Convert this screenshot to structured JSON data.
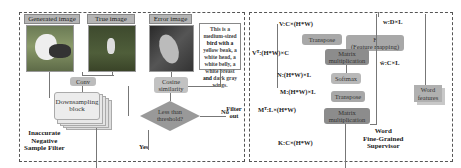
{
  "left_panel": {
    "title": "Inaccurate\nNegative\nSample Filter",
    "title_lines": [
      "Inaccurate",
      "Negative",
      "Sample Filter"
    ],
    "images": [
      {
        "label": "Generated image"
      },
      {
        "label": "True image"
      },
      {
        "label": "Error image"
      }
    ],
    "description_parts": [
      "This is a medium-sized ",
      "bird with a",
      " yellow beak, a white head, a white belly, a white breast ",
      "and",
      " dark gray wings."
    ],
    "conv": "Conv",
    "downsampling": "Downsampling block",
    "cosine": "Cosine similarity",
    "decision": "Less than threshold?",
    "no_label": "No",
    "yes_label": "Yes",
    "filter_out": "Filter out"
  },
  "right_panel": {
    "title_lines": [
      "Word",
      "Fine-Grained",
      "Supervisor"
    ],
    "v": "V:C×(H*W)",
    "vt": "Vᵀ:(H*W)×C",
    "n": "N:(H*W)×L",
    "m": "M:(H*W)×L",
    "mt": "Mᵀ:L×(H*W)",
    "k": "K:C×(H*W)",
    "w": "w:D×L",
    "w_hat": "ŵ:C×L",
    "transpose1": "Transpose",
    "transpose2": "Transpose",
    "matmul1": "Matrix multiplication",
    "matmul2": "Matrix multiplication",
    "softmax": "Softmax",
    "feature_mapping": "F (Feature mapping)",
    "f_label": "F",
    "fm_label": "(Feature mapping)"
  },
  "word_features": "Word features"
}
